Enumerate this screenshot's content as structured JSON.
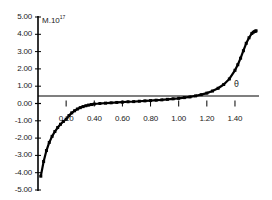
{
  "chart_data": {
    "type": "line",
    "title": "",
    "subtitle": "",
    "xlabel": "θ",
    "ylabel": "M.10",
    "ylabel_exponent": "17",
    "xlim": [
      0.0,
      1.5708
    ],
    "ylim": [
      -5.0,
      5.0
    ],
    "grid": false,
    "legend": null,
    "marker": "filled-square",
    "line_color": "#000000",
    "x_tick_labels": [
      "0.20",
      "0.40",
      "0.60",
      "0.80",
      "1.00",
      "1.20",
      "1.40"
    ],
    "x_ticks": [
      0.2,
      0.4,
      0.6,
      0.8,
      1.0,
      1.2,
      1.4
    ],
    "y_tick_labels": [
      "5.00",
      "4.00",
      "3.00",
      "2.00",
      "1.00",
      "0.00",
      "-1.00",
      "-2.00",
      "-3.00",
      "-4.00",
      "-5.00"
    ],
    "y_ticks": [
      5,
      4,
      3,
      2,
      1,
      0,
      -1,
      -2,
      -3,
      -4,
      -5
    ],
    "series": [
      {
        "name": "M",
        "x": [
          0.02,
          0.04,
          0.06,
          0.08,
          0.1,
          0.12,
          0.14,
          0.16,
          0.18,
          0.2,
          0.22,
          0.24,
          0.26,
          0.28,
          0.3,
          0.32,
          0.34,
          0.36,
          0.38,
          0.4,
          0.44,
          0.48,
          0.52,
          0.56,
          0.6,
          0.64,
          0.68,
          0.72,
          0.76,
          0.8,
          0.84,
          0.88,
          0.92,
          0.96,
          1.0,
          1.04,
          1.08,
          1.12,
          1.16,
          1.2,
          1.24,
          1.28,
          1.32,
          1.36,
          1.4,
          1.42,
          1.44,
          1.46,
          1.48,
          1.5,
          1.52,
          1.53,
          1.54,
          1.545,
          1.55
        ],
        "y": [
          -4.2,
          -3.35,
          -2.72,
          -2.25,
          -1.9,
          -1.62,
          -1.39,
          -1.2,
          -1.04,
          -0.91,
          -0.7,
          -0.54,
          -0.42,
          -0.32,
          -0.24,
          -0.18,
          -0.13,
          -0.09,
          -0.06,
          -0.03,
          0.0,
          0.02,
          0.04,
          0.06,
          0.08,
          0.1,
          0.11,
          0.13,
          0.15,
          0.17,
          0.19,
          0.21,
          0.24,
          0.27,
          0.3,
          0.34,
          0.38,
          0.44,
          0.51,
          0.6,
          0.72,
          0.88,
          1.1,
          1.42,
          1.92,
          2.24,
          2.62,
          3.05,
          3.48,
          3.8,
          4.05,
          4.12,
          4.16,
          4.18,
          4.2
        ],
        "color": "#000000"
      }
    ],
    "axis_lines": {
      "y_axis_at_x": 0.0,
      "x_axis_at_y": 0.0,
      "color": "#000000"
    }
  }
}
